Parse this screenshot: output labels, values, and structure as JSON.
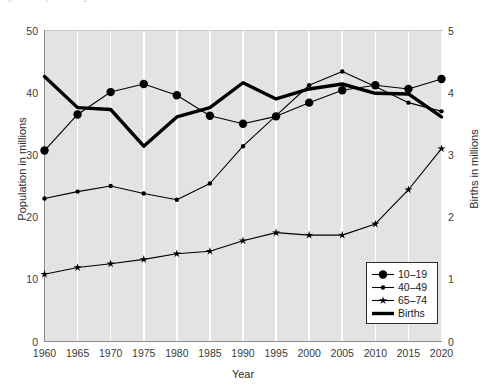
{
  "figure": {
    "top_cut_text": "Figure 3.  Population aged 10–19, 40–49 and 65–74, and annual births",
    "background": "#ffffff",
    "plot_background": "#e3e3e3",
    "gridline_color": "#ffffff",
    "series_color": "#000000"
  },
  "axes": {
    "x": {
      "label": "Year",
      "ticks": [
        "1960",
        "1965",
        "1970",
        "1975",
        "1980",
        "1985",
        "1990",
        "1995",
        "2000",
        "2005",
        "2010",
        "2015",
        "2020"
      ],
      "min": 1960,
      "max": 2020
    },
    "y_left": {
      "label": "Population in millions",
      "ticks": [
        "0",
        "10",
        "20",
        "30",
        "40",
        "50"
      ],
      "min": 0,
      "max": 50
    },
    "y_right": {
      "label": "Births in millions",
      "ticks": [
        "0",
        "1",
        "2",
        "3",
        "4",
        "5"
      ],
      "min": 0,
      "max": 5
    }
  },
  "legend": {
    "position": "bottom-right-inside",
    "items": [
      {
        "label": "10–19",
        "marker": "large-circle",
        "line": "thin"
      },
      {
        "label": "40–49",
        "marker": "small-circle",
        "line": "thin"
      },
      {
        "label": "65–74",
        "marker": "star",
        "line": "thin"
      },
      {
        "label": "Births",
        "marker": "none",
        "line": "thick"
      }
    ]
  },
  "chart_data": {
    "type": "line",
    "title": "",
    "xlabel": "Year",
    "ylabel": "Population in millions",
    "ylabel_right": "Births in millions",
    "xlim": [
      1960,
      2020
    ],
    "ylim": [
      0,
      50
    ],
    "ylim_right": [
      0,
      5
    ],
    "grid": "vertical-only",
    "legend_position": "lower right",
    "x": [
      1960,
      1965,
      1970,
      1975,
      1980,
      1985,
      1990,
      1995,
      2000,
      2005,
      2010,
      2015,
      2020
    ],
    "series": [
      {
        "name": "10–19",
        "axis": "left",
        "unit": "millions",
        "marker": "large-circle",
        "values": [
          30.7,
          36.5,
          40.1,
          41.4,
          39.6,
          36.3,
          35.0,
          36.2,
          38.4,
          40.4,
          41.2,
          40.6,
          42.2
        ]
      },
      {
        "name": "40–49",
        "axis": "left",
        "unit": "millions",
        "marker": "small-circle",
        "values": [
          23.0,
          24.1,
          25.0,
          23.8,
          22.8,
          25.4,
          31.4,
          36.3,
          41.2,
          43.4,
          41.0,
          38.4,
          37.0
        ]
      },
      {
        "name": "65–74",
        "axis": "left",
        "unit": "millions",
        "marker": "star",
        "values": [
          10.8,
          11.9,
          12.5,
          13.2,
          14.1,
          14.5,
          16.2,
          17.5,
          17.1,
          17.1,
          18.9,
          24.4,
          31.0
        ]
      },
      {
        "name": "Births",
        "axis": "right",
        "unit": "millions",
        "marker": "none",
        "line": "thick",
        "values": [
          4.26,
          3.76,
          3.73,
          3.14,
          3.61,
          3.76,
          4.16,
          3.9,
          4.06,
          4.14,
          3.99,
          3.98,
          3.61
        ]
      }
    ]
  }
}
